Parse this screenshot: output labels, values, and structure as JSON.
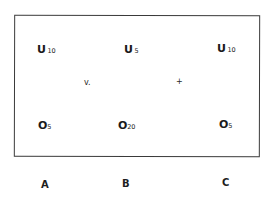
{
  "diagram": {
    "columns": [
      {
        "label": "A",
        "top": {
          "symbol": "U",
          "subscript": "10"
        },
        "bottom": {
          "symbol": "O",
          "subscript": "5"
        }
      },
      {
        "label": "B",
        "top": {
          "symbol": "U",
          "subscript": "5"
        },
        "bottom": {
          "symbol": "O",
          "subscript": "20"
        }
      },
      {
        "label": "C",
        "top": {
          "symbol": "U",
          "subscript": "10"
        },
        "bottom": {
          "symbol": "O",
          "subscript": "5"
        }
      }
    ],
    "operators": [
      {
        "between": "A-B",
        "text": "v."
      },
      {
        "between": "B-C",
        "text": "+"
      }
    ],
    "colors": {
      "border": "#3a3a3a",
      "text": "#1a1a1a",
      "background": "#ffffff"
    }
  }
}
